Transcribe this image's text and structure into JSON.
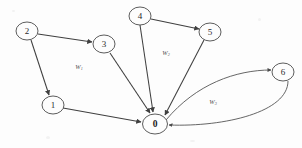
{
  "diagram": {
    "background_color": "#fdfdfd",
    "stroke_color": "#3f3f3f",
    "nodes": [
      {
        "id": "n0",
        "label": "0",
        "cx": 155,
        "cy": 124,
        "rx": 12.5,
        "ry": 10,
        "emphasis": "bold"
      },
      {
        "id": "n1",
        "label": "1",
        "cx": 53,
        "cy": 105,
        "rx": 11,
        "ry": 9,
        "emphasis": "normal"
      },
      {
        "id": "n2",
        "label": "2",
        "cx": 27,
        "cy": 31,
        "rx": 11,
        "ry": 9,
        "emphasis": "normal"
      },
      {
        "id": "n3",
        "label": "3",
        "cx": 104,
        "cy": 44,
        "rx": 11,
        "ry": 9,
        "emphasis": "normal"
      },
      {
        "id": "n4",
        "label": "4",
        "cx": 140,
        "cy": 16,
        "rx": 11,
        "ry": 9,
        "emphasis": "normal"
      },
      {
        "id": "n5",
        "label": "5",
        "cx": 210,
        "cy": 32,
        "rx": 11,
        "ry": 9,
        "emphasis": "normal"
      },
      {
        "id": "n6",
        "label": "6",
        "cx": 283,
        "cy": 72,
        "rx": 11,
        "ry": 9,
        "emphasis": "normal"
      }
    ],
    "edges": [
      {
        "id": "e-2-3",
        "from": "2",
        "to": "3",
        "shape": "straight"
      },
      {
        "id": "e-2-1",
        "from": "2",
        "to": "1",
        "shape": "straight"
      },
      {
        "id": "e-1-0",
        "from": "1",
        "to": "0",
        "shape": "straight"
      },
      {
        "id": "e-3-0",
        "from": "3",
        "to": "0",
        "shape": "straight"
      },
      {
        "id": "e-4-5",
        "from": "4",
        "to": "5",
        "shape": "straight"
      },
      {
        "id": "e-4-0",
        "from": "4",
        "to": "0",
        "shape": "straight"
      },
      {
        "id": "e-5-0",
        "from": "5",
        "to": "0",
        "shape": "straight"
      },
      {
        "id": "e-0-6",
        "from": "0",
        "to": "6",
        "shape": "curve-upper"
      },
      {
        "id": "e-6-0",
        "from": "6",
        "to": "0",
        "shape": "curve-lower"
      }
    ],
    "weight_labels": [
      {
        "id": "w-left",
        "base": "W",
        "subscript": "1",
        "x": 79,
        "y": 66
      },
      {
        "id": "w-middle",
        "base": "W",
        "subscript": "2",
        "x": 166,
        "y": 52
      },
      {
        "id": "w-right",
        "base": "W",
        "subscript": "3",
        "x": 213,
        "y": 101
      }
    ]
  }
}
